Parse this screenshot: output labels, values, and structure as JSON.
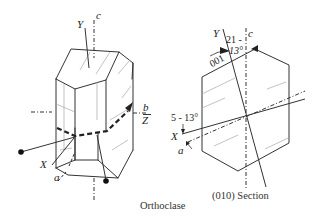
{
  "figure": {
    "left_panel": {
      "caption": "Orthoclase",
      "labels": {
        "y": "Y",
        "c": "c",
        "b": "b",
        "z": "Z",
        "x": "X",
        "a": "a"
      }
    },
    "right_panel": {
      "caption": "(010) Section",
      "labels": {
        "y": "Y",
        "c": "c",
        "face": "001",
        "angle_top_line1": "21 -",
        "angle_top_line2": "13°",
        "angle_left": "5 - 13°",
        "x": "X",
        "a": "a"
      }
    },
    "colors": {
      "line": "#333333",
      "thin_line": "#9a9a9a",
      "background": "#ffffff"
    }
  }
}
